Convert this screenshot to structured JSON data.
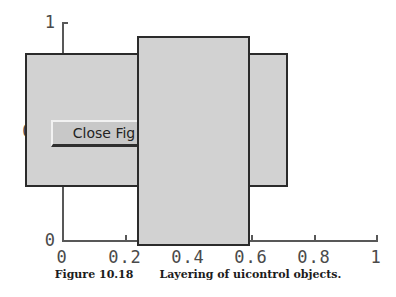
{
  "figure": {
    "caption_number": "Figure 10.18",
    "caption_text": "Layering of uicontrol objects."
  },
  "axes": {
    "x": {
      "min": 0,
      "max": 1,
      "ticks": [
        0,
        0.2,
        0.4,
        0.6,
        0.8,
        1
      ],
      "tick_labels": [
        "0",
        "0.2",
        "0.4",
        "0.6",
        "0.8",
        "1"
      ]
    },
    "y": {
      "min": 0,
      "max": 1,
      "ticks": [
        0,
        0.5,
        1
      ],
      "tick_labels": [
        "0",
        "0.5",
        "1"
      ]
    }
  },
  "uicontrols": [
    {
      "name": "frame-back-left",
      "style": "frame",
      "fill_color": "#d2d2d2",
      "edge_color": "#2b2b2b",
      "layer": "back"
    },
    {
      "name": "frame-back-right",
      "style": "frame",
      "fill_color": "#d2d2d2",
      "edge_color": "#2b2b2b",
      "layer": "back"
    },
    {
      "name": "frame-front-middle",
      "style": "frame",
      "fill_color": "#d2d2d2",
      "edge_color": "#2b2b2b",
      "layer": "front"
    }
  ],
  "button": {
    "label": "Close Fig",
    "style": "pushbutton",
    "face_color": "#c8c8c8",
    "text_color": "#232323"
  },
  "colors": {
    "background": "#ffffff",
    "axis": "#585858",
    "tick_label": "#4a4a4a",
    "frame_fill": "#d2d2d2",
    "frame_edge": "#2b2b2b"
  }
}
